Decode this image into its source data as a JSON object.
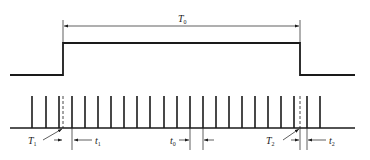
{
  "diagram": {
    "type": "timing-diagram",
    "gate": {
      "label": "T",
      "label_sub": "0",
      "low_y": 75,
      "high_y": 43,
      "start_x": 10,
      "rise_x": 63,
      "fall_x": 300,
      "end_x": 355
    },
    "clock": {
      "baseline_y": 128,
      "pulse_top_y": 96,
      "baseline_start_x": 10,
      "baseline_end_x": 355,
      "pulse_xs": [
        32,
        46,
        59,
        72,
        85,
        98,
        111,
        124,
        137,
        150,
        164,
        177,
        190,
        203,
        216,
        229,
        242,
        255,
        268,
        281,
        294,
        307,
        320
      ]
    },
    "annotations": {
      "T1": {
        "label": "T",
        "sub": "1"
      },
      "t1": {
        "label": "t",
        "sub": "1"
      },
      "t0": {
        "label": "t",
        "sub": "0"
      },
      "T2": {
        "label": "T",
        "sub": "2"
      },
      "t2": {
        "label": "t",
        "sub": "2"
      }
    },
    "colors": {
      "stroke": "#1a1a1a",
      "background": "#ffffff"
    }
  }
}
